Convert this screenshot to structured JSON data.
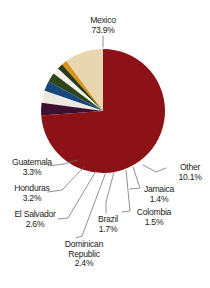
{
  "chart_data": {
    "type": "pie",
    "title": "",
    "xlabel": "",
    "ylabel": "",
    "legend_position": "callout-labels",
    "grid": false,
    "units": "percent",
    "total": 100.1,
    "categories": [
      "Mexico",
      "Other",
      "Guatemala",
      "Honduras",
      "El Salvador",
      "Dominican Republic",
      "Brazil",
      "Colombia",
      "Jamaica"
    ],
    "values": [
      73.9,
      10.1,
      3.3,
      3.2,
      2.6,
      2.4,
      1.7,
      1.5,
      1.4
    ],
    "slices": [
      {
        "label": "Mexico",
        "value": 73.9,
        "percent_text": "73.9%",
        "color": "#8c1218"
      },
      {
        "label": "Guatemala",
        "value": 3.3,
        "percent_text": "3.3%",
        "color": "#3d1030"
      },
      {
        "label": "Honduras",
        "value": 3.2,
        "percent_text": "3.2%",
        "color": "#eceae3"
      },
      {
        "label": "El Salvador",
        "value": 2.6,
        "percent_text": "2.6%",
        "color": "#17477d"
      },
      {
        "label": "Dominican Republic",
        "value": 2.4,
        "percent_text": "2.4%",
        "color": "#2f4418"
      },
      {
        "label": "Brazil",
        "value": 1.7,
        "percent_text": "1.7%",
        "color": "#f4f2ea"
      },
      {
        "label": "Colombia",
        "value": 1.5,
        "percent_text": "1.5%",
        "color": "#2b3b1a"
      },
      {
        "label": "Jamaica",
        "value": 1.4,
        "percent_text": "1.4%",
        "color": "#d99318"
      },
      {
        "label": "Other",
        "value": 10.1,
        "percent_text": "10.1%",
        "color": "#e8d6b0"
      }
    ]
  },
  "labels": {
    "mexico": {
      "name": "Mexico",
      "percent": "73.9%"
    },
    "guatemala": {
      "name": "Guatemala",
      "percent": "3.3%"
    },
    "honduras": {
      "name": "Honduras",
      "percent": "3.2%"
    },
    "el_salvador": {
      "name": "El Salvador",
      "percent": "2.6%"
    },
    "dominican": {
      "name1": "Dominican",
      "name2": "Republic",
      "percent": "2.4%"
    },
    "brazil": {
      "name": "Brazil",
      "percent": "1.7%"
    },
    "colombia": {
      "name": "Colombia",
      "percent": "1.5%"
    },
    "jamaica": {
      "name": "Jamaica",
      "percent": "1.4%"
    },
    "other": {
      "name": "Other",
      "percent": "10.1%"
    }
  },
  "colors": {
    "mexico": "#8c1218",
    "other": "#e8d6b0",
    "guatemala": "#3d1030",
    "honduras": "#eceae3",
    "el_salvador": "#17477d",
    "dominican_republic": "#2f4418",
    "brazil": "#f4f2ea",
    "colombia": "#2b3b1a",
    "jamaica": "#d99318",
    "background": "#ffffff",
    "text": "#1c1c1c",
    "leader_line": "#6d6d6d"
  }
}
